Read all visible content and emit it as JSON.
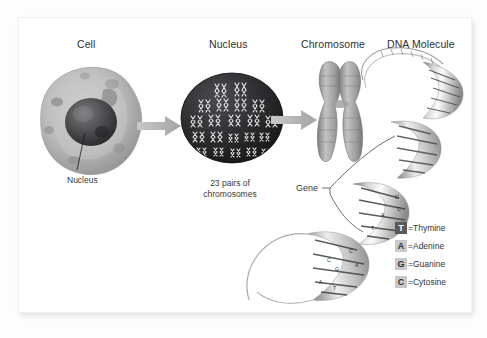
{
  "figure": {
    "title_columns": [
      {
        "id": "cell",
        "label": "Cell"
      },
      {
        "id": "nucleus",
        "label": "Nucleus"
      },
      {
        "id": "chromosome",
        "label": "Chromosome"
      },
      {
        "id": "dna",
        "label": "DNA Molecule"
      }
    ],
    "annotations": {
      "cell_nucleus_label": "Nucleus",
      "chromosome_count_line1": "23 pairs of",
      "chromosome_count_line2": "chromosomes",
      "gene_label": "Gene"
    },
    "legend": {
      "items": [
        {
          "code": "T",
          "equals": "=",
          "name": "Thymine",
          "swatch_bg": "#58585a",
          "swatch_fg": "#ffffff"
        },
        {
          "code": "A",
          "equals": "=",
          "name": "Adenine",
          "swatch_bg": "#c8c8c8",
          "swatch_fg": "#333333"
        },
        {
          "code": "G",
          "equals": "=",
          "name": "Guanine",
          "swatch_bg": "#c8c8c8",
          "swatch_fg": "#333333"
        },
        {
          "code": "C",
          "equals": "=",
          "name": "Cytosine",
          "swatch_bg": "#c8c8c8",
          "swatch_fg": "#333333"
        }
      ]
    },
    "dna_bases_shown": [
      "G",
      "C",
      "A",
      "T",
      "C",
      "A",
      "G",
      "C",
      "A",
      "T"
    ],
    "colors": {
      "card_background": "#ffffff",
      "page_background": "#fdfdfd",
      "arrow": "#b0b0b0",
      "heading_text": "#2e2e2e",
      "nucleus_fill": "#2b2b2d",
      "chromosome_fill": "#9a9a9a",
      "leader_line": "#1a1a1a"
    }
  }
}
